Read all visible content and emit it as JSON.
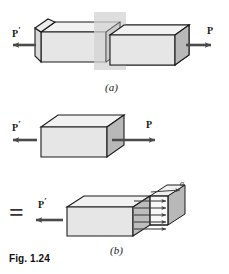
{
  "figure": {
    "caption": "Fig. 1.24",
    "sublabel_a": "(a)",
    "sublabel_b": "(b)",
    "equals_sign": "=",
    "stress_symbol": "σ",
    "force_left": "P",
    "force_left_prime": "′",
    "force_right": "P",
    "panels": [
      {
        "id": "a",
        "description": "Two-segment prismatic bar separated by a transparent cutting plane, loaded in axial tension",
        "labels": [
          "P′",
          "P",
          "(a)"
        ],
        "cutting_plane": true,
        "arrow_left_direction": "left",
        "arrow_right_direction": "right"
      },
      {
        "id": "free-body",
        "description": "Short prismatic bar free body with axial tensile forces at both ends",
        "labels": [
          "P′",
          "P"
        ],
        "cutting_plane": false,
        "arrow_left_direction": "left",
        "arrow_right_direction": "right"
      },
      {
        "id": "b",
        "description": "Free body with distributed normal stress sigma on the exposed section replacing force P",
        "labels": [
          "=",
          "P′",
          "σ",
          "(b)"
        ],
        "cutting_plane": false,
        "stress_arrow_count": 5,
        "arrow_left_direction": "left"
      }
    ],
    "colors": {
      "outline": "#1a1a1a",
      "top_face": "#f2f2f2",
      "front_face": "#e6e6e6",
      "side_face": "#b8b8b8",
      "cut_face": "#c9c9c9",
      "cutting_plane": "#d2d2d2",
      "arrow": "#4a4a4a",
      "text": "#1a1a1a",
      "background": "#ffffff"
    }
  }
}
